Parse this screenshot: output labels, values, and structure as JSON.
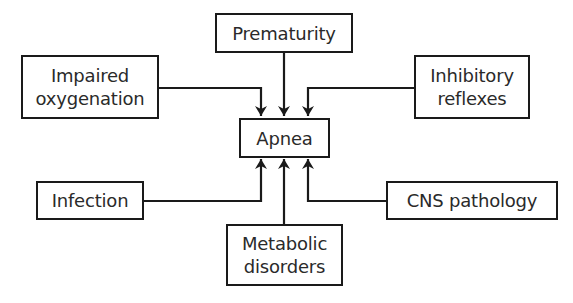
{
  "diagram": {
    "type": "flowchart",
    "center": {
      "id": "apnea",
      "lines": [
        "Apnea"
      ]
    },
    "causes": [
      {
        "id": "prematurity",
        "lines": [
          "Prematurity"
        ]
      },
      {
        "id": "impaired-oxygenation",
        "lines": [
          "Impaired",
          "oxygenation"
        ]
      },
      {
        "id": "inhibitory-reflexes",
        "lines": [
          "Inhibitory",
          "reflexes"
        ]
      },
      {
        "id": "infection",
        "lines": [
          "Infection"
        ]
      },
      {
        "id": "cns-pathology",
        "lines": [
          "CNS pathology"
        ]
      },
      {
        "id": "metabolic-disorders",
        "lines": [
          "Metabolic",
          "disorders"
        ]
      }
    ],
    "edges": [
      {
        "from": "prematurity",
        "to": "apnea"
      },
      {
        "from": "impaired-oxygenation",
        "to": "apnea"
      },
      {
        "from": "inhibitory-reflexes",
        "to": "apnea"
      },
      {
        "from": "infection",
        "to": "apnea"
      },
      {
        "from": "cns-pathology",
        "to": "apnea"
      },
      {
        "from": "metabolic-disorders",
        "to": "apnea"
      }
    ],
    "colors": {
      "stroke": "#1a1a1a",
      "text": "#2a2a2a",
      "background": "#ffffff"
    }
  }
}
